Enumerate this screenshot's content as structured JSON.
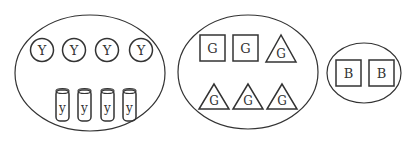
{
  "groups": [
    {
      "name": "Y group",
      "circles": [
        "Y",
        "Y",
        "Y",
        "Y"
      ],
      "cylinders": [
        "y",
        "y",
        "y",
        "y"
      ]
    },
    {
      "name": "G group",
      "squares": [
        "G",
        "G"
      ],
      "triangles_top": [
        "G"
      ],
      "triangles_bottom": [
        "G",
        "G",
        "G"
      ]
    },
    {
      "name": "B group",
      "squares": [
        "B",
        "B"
      ]
    }
  ],
  "colors": {
    "stroke": "#333333",
    "background": "#ffffff"
  }
}
